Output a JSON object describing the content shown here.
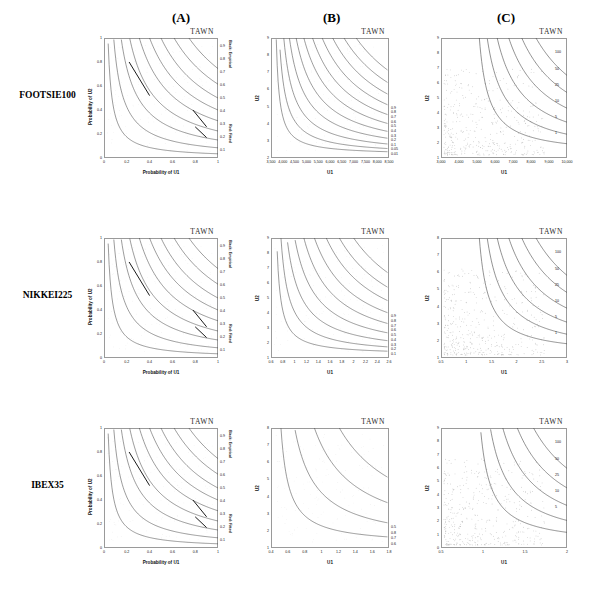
{
  "figure": {
    "column_headers": [
      {
        "id": "A",
        "label": "(A)"
      },
      {
        "id": "B",
        "label": "(B)"
      },
      {
        "id": "C",
        "label": "(C)"
      }
    ],
    "row_labels": [
      "FOOTSIE100",
      "NIKKEI225",
      "IBEX35"
    ],
    "model_name": "TAWN",
    "legend_notes": {
      "empirical": "Black: Empirical",
      "fitted": "Red: Fitted"
    },
    "colors": {
      "curve": "#4a4a4a",
      "fitted": "#1a1a1a",
      "scatter": "#b9b9b9",
      "frame": "#9a9a9a"
    }
  },
  "chart_data": [
    {
      "id": "footsie-A",
      "type": "line",
      "panel": "A",
      "row": "FOOTSIE100",
      "title": "TAWN",
      "xlabel": "Probability of U1",
      "ylabel": "Probability of U2",
      "xlim": [
        0,
        1
      ],
      "ylim": [
        0,
        1
      ],
      "xticks": [
        "0",
        "0.2",
        "0.4",
        "0.6",
        "0.8",
        "1"
      ],
      "yticks": [
        "0",
        "0.2",
        "0.4",
        "0.6",
        "0.8",
        "1"
      ],
      "right_ticks": [
        "0.9",
        "0.8",
        "0.7",
        "0.6",
        "0.5",
        "0.4",
        "0.3",
        "0.2",
        "0.1"
      ],
      "right_note_top": "Black: Empirical",
      "right_note_bottom": "Red: Fitted",
      "grid": false,
      "series": [
        {
          "name": "C=0.1",
          "level": 0.1
        },
        {
          "name": "C=0.2",
          "level": 0.2
        },
        {
          "name": "C=0.3",
          "level": 0.3
        },
        {
          "name": "C=0.4",
          "level": 0.4
        },
        {
          "name": "C=0.5",
          "level": 0.5
        },
        {
          "name": "C=0.6",
          "level": 0.6
        },
        {
          "name": "C=0.7",
          "level": 0.7
        },
        {
          "name": "C=0.8",
          "level": 0.8
        },
        {
          "name": "C=0.9",
          "level": 0.9
        }
      ]
    },
    {
      "id": "footsie-B",
      "type": "line",
      "panel": "B",
      "row": "FOOTSIE100",
      "title": "TAWN",
      "xlabel": "U1",
      "ylabel": "U2",
      "xlim": [
        3500,
        8500
      ],
      "ylim": [
        2,
        9
      ],
      "xticks": [
        "3,500",
        "4,000",
        "4,500",
        "5,000",
        "5,500",
        "6,000",
        "6,500",
        "7,000",
        "7,500",
        "8,000",
        "8,500"
      ],
      "yticks": [
        "2",
        "3",
        "4",
        "5",
        "6",
        "7",
        "8",
        "9"
      ],
      "contour_labels": [
        "0.9",
        "0.8",
        "0.7",
        "0.6",
        "0.5",
        "0.4",
        "0.3",
        "0.2",
        "0.1",
        "0.05",
        "0.01"
      ],
      "grid": false
    },
    {
      "id": "footsie-C",
      "type": "line",
      "panel": "C",
      "row": "FOOTSIE100",
      "title": "TAWN",
      "xlabel": "U1",
      "ylabel": "U2",
      "xlim": [
        3000,
        10000
      ],
      "ylim": [
        1,
        9
      ],
      "xticks": [
        "3,000",
        "4,000",
        "5,000",
        "6,000",
        "7,000",
        "8,000",
        "9,000",
        "10,000"
      ],
      "yticks": [
        "1",
        "2",
        "3",
        "4",
        "5",
        "6",
        "7",
        "8",
        "9"
      ],
      "contour_labels": [
        "100",
        "50",
        "25",
        "10",
        "5",
        "1"
      ],
      "grid": false,
      "scatter": true
    },
    {
      "id": "nikkei-A",
      "type": "line",
      "panel": "A",
      "row": "NIKKEI225",
      "title": "TAWN",
      "xlabel": "Probability of U1",
      "ylabel": "Probability of U2",
      "xlim": [
        0,
        1
      ],
      "ylim": [
        0,
        1
      ],
      "xticks": [
        "0",
        "0.2",
        "0.4",
        "0.6",
        "0.8",
        "1"
      ],
      "yticks": [
        "0",
        "0.2",
        "0.4",
        "0.6",
        "0.8",
        "1"
      ],
      "right_ticks": [
        "0.9",
        "0.8",
        "0.7",
        "0.6",
        "0.5",
        "0.4",
        "0.3",
        "0.2",
        "0.1"
      ],
      "right_note_top": "Black: Empirical",
      "right_note_bottom": "Red: Fitted",
      "grid": false
    },
    {
      "id": "nikkei-B",
      "type": "line",
      "panel": "B",
      "row": "NIKKEI225",
      "title": "TAWN",
      "xlabel": "U1",
      "ylabel": "U2",
      "xlim": [
        0.6,
        2.6
      ],
      "ylim": [
        1,
        9
      ],
      "xticks": [
        "0.6",
        "0.8",
        "1",
        "1.2",
        "1.4",
        "1.6",
        "1.8",
        "2",
        "2.2",
        "2.4",
        "2.6"
      ],
      "yticks": [
        "1",
        "2",
        "3",
        "4",
        "5",
        "6",
        "7",
        "8",
        "9"
      ],
      "contour_labels": [
        "0.9",
        "0.8",
        "0.7",
        "0.6",
        "0.5",
        "0.4",
        "0.3",
        "0.2",
        "0.1"
      ],
      "grid": false
    },
    {
      "id": "nikkei-C",
      "type": "line",
      "panel": "C",
      "row": "NIKKEI225",
      "title": "TAWN",
      "xlabel": "U1",
      "ylabel": "U2",
      "xlim": [
        0.5,
        3
      ],
      "ylim": [
        1,
        8
      ],
      "xticks": [
        "0.5",
        "1",
        "1.5",
        "2",
        "2.5",
        "3"
      ],
      "yticks": [
        "1",
        "2",
        "3",
        "4",
        "5",
        "6",
        "7",
        "8"
      ],
      "contour_labels": [
        "100",
        "50",
        "25",
        "10",
        "5",
        "1"
      ],
      "grid": false,
      "scatter": true
    },
    {
      "id": "ibex-A",
      "type": "line",
      "panel": "A",
      "row": "IBEX35",
      "title": "TAWN",
      "xlabel": "Probability of U1",
      "ylabel": "Probability of U2",
      "xlim": [
        0,
        1
      ],
      "ylim": [
        0,
        1
      ],
      "xticks": [
        "0",
        "0.2",
        "0.4",
        "0.6",
        "0.8",
        "1"
      ],
      "yticks": [
        "0",
        "0.2",
        "0.4",
        "0.6",
        "0.8",
        "1"
      ],
      "right_ticks": [
        "0.9",
        "0.8",
        "0.7",
        "0.6",
        "0.5",
        "0.4",
        "0.3",
        "0.2",
        "0.1"
      ],
      "right_note_top": "Black: Empirical",
      "right_note_bottom": "Red: Fitted",
      "grid": false
    },
    {
      "id": "ibex-B",
      "type": "line",
      "panel": "B",
      "row": "IBEX35",
      "title": "TAWN",
      "xlabel": "U1",
      "ylabel": "U2",
      "xlim": [
        0.4,
        1.8
      ],
      "ylim": [
        1,
        8
      ],
      "xticks": [
        "0.4",
        "0.6",
        "0.8",
        "1",
        "1.2",
        "1.4",
        "1.6",
        "1.8"
      ],
      "yticks": [
        "1",
        "2",
        "3",
        "4",
        "5",
        "6",
        "7",
        "8"
      ],
      "contour_labels": [
        "0.5",
        "0.8",
        "0.7",
        "0.6"
      ],
      "grid": false
    },
    {
      "id": "ibex-C",
      "type": "line",
      "panel": "C",
      "row": "IBEX35",
      "title": "TAWN",
      "xlabel": "U1",
      "ylabel": "U2",
      "xlim": [
        0.5,
        2
      ],
      "ylim": [
        0,
        9
      ],
      "xticks": [
        "0.5",
        "1",
        "1.5",
        "2"
      ],
      "yticks": [
        "0",
        "1",
        "2",
        "3",
        "4",
        "5",
        "6",
        "7",
        "8",
        "9"
      ],
      "contour_labels": [
        "100",
        "50",
        "25",
        "10",
        "5"
      ],
      "grid": false,
      "scatter": true
    }
  ]
}
